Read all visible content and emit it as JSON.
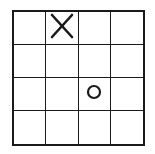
{
  "game": {
    "type": "tic-tac-toe",
    "rows": 4,
    "cols": 4,
    "line_color": "#1a1a1a",
    "board": [
      [
        "",
        "X",
        "",
        ""
      ],
      [
        "",
        "",
        "",
        ""
      ],
      [
        "",
        "",
        "O",
        ""
      ],
      [
        "",
        "",
        "",
        ""
      ]
    ]
  },
  "icons": {
    "X": "x-mark-icon",
    "O": "o-mark-icon"
  }
}
